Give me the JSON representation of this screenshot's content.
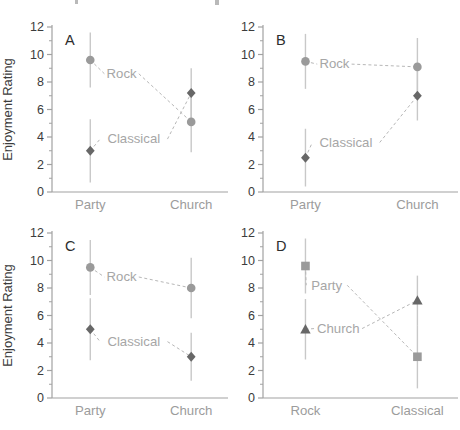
{
  "figure": {
    "title": "",
    "ylabel": "Enjoyment Rating",
    "background": "#ffffff",
    "artifacts": {
      "top_edge_cropped_text_fragments": 2
    },
    "colors": {
      "axis": "#a2a2a2",
      "tick_label": "#3c3c3c",
      "panel_letter": "#2d2d2d",
      "category_label": "#9c9c9c",
      "series_label": "#a6a6a6",
      "error_bar": "#c8c8c8",
      "dashed_line": "#b7b7b7",
      "marker_light": "#9a9a9a",
      "marker_dark": "#676767"
    }
  },
  "chart_data": [
    {
      "panel": "A",
      "type": "line",
      "categories": [
        "Party",
        "Church"
      ],
      "xlabel": "",
      "ylabel": "Enjoyment Rating",
      "show_ylabel": true,
      "ylim": [
        0,
        12
      ],
      "yticks": [
        0,
        2,
        4,
        6,
        8,
        10,
        12
      ],
      "minor_ticks": [
        1,
        3,
        5,
        7,
        9,
        11
      ],
      "grid": false,
      "legend_position": "on-line-labels",
      "series": [
        {
          "name": "Rock",
          "marker": "circle",
          "shade": "light",
          "values": [
            9.6,
            5.1
          ],
          "errors": [
            2.0,
            2.2
          ],
          "label_x": 0.4,
          "label_y": 8.6
        },
        {
          "name": "Classical",
          "marker": "diamond",
          "shade": "dark",
          "values": [
            3.0,
            7.2
          ],
          "errors": [
            2.3,
            1.8
          ],
          "label_x": 0.47,
          "label_y": 3.85
        }
      ]
    },
    {
      "panel": "B",
      "type": "line",
      "categories": [
        "Party",
        "Church"
      ],
      "xlabel": "",
      "ylabel": "Enjoyment Rating",
      "show_ylabel": false,
      "ylim": [
        0,
        12
      ],
      "yticks": [
        0,
        2,
        4,
        6,
        8,
        10,
        12
      ],
      "minor_ticks": [
        1,
        3,
        5,
        7,
        9,
        11
      ],
      "grid": false,
      "legend_position": "on-line-labels",
      "series": [
        {
          "name": "Rock",
          "marker": "circle",
          "shade": "light",
          "values": [
            9.5,
            9.1
          ],
          "errors": [
            2.0,
            2.1
          ],
          "label_x": 0.37,
          "label_y": 9.3
        },
        {
          "name": "Classical",
          "marker": "diamond",
          "shade": "dark",
          "values": [
            2.5,
            7.0
          ],
          "errors": [
            2.1,
            1.8
          ],
          "label_x": 0.43,
          "label_y": 3.6
        }
      ]
    },
    {
      "panel": "C",
      "type": "line",
      "categories": [
        "Party",
        "Church"
      ],
      "xlabel": "",
      "ylabel": "Enjoyment Rating",
      "show_ylabel": true,
      "ylim": [
        0,
        12
      ],
      "yticks": [
        0,
        2,
        4,
        6,
        8,
        10,
        12
      ],
      "minor_ticks": [
        1,
        3,
        5,
        7,
        9,
        11
      ],
      "grid": false,
      "legend_position": "on-line-labels",
      "series": [
        {
          "name": "Rock",
          "marker": "circle",
          "shade": "light",
          "values": [
            9.5,
            8.0
          ],
          "errors": [
            2.0,
            2.2
          ],
          "label_x": 0.4,
          "label_y": 8.8
        },
        {
          "name": "Classical",
          "marker": "diamond",
          "shade": "dark",
          "values": [
            5.0,
            3.0
          ],
          "errors": [
            2.25,
            1.75
          ],
          "label_x": 0.47,
          "label_y": 4.1
        }
      ]
    },
    {
      "panel": "D",
      "type": "line",
      "categories": [
        "Rock",
        "Classical"
      ],
      "xlabel": "",
      "ylabel": "Enjoyment Rating",
      "show_ylabel": false,
      "ylim": [
        0,
        12
      ],
      "yticks": [
        0,
        2,
        4,
        6,
        8,
        10,
        12
      ],
      "minor_ticks": [
        1,
        3,
        5,
        7,
        9,
        11
      ],
      "grid": false,
      "legend_position": "on-line-labels",
      "series": [
        {
          "name": "Party",
          "marker": "square",
          "shade": "light",
          "values": [
            9.6,
            3.0
          ],
          "errors": [
            2.0,
            2.3
          ],
          "label_x": 0.33,
          "label_y": 8.2
        },
        {
          "name": "Church",
          "marker": "triangle",
          "shade": "dark",
          "values": [
            5.0,
            7.1
          ],
          "errors": [
            2.2,
            1.8
          ],
          "label_x": 0.39,
          "label_y": 5.05
        }
      ]
    }
  ]
}
